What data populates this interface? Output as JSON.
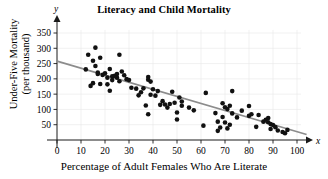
{
  "chart_data": {
    "type": "scatter",
    "title": "Literacy and Child Mortality",
    "xlabel": "Percentage of Adult Females Who Are Literate",
    "ylabel": "Under-Five Mortality (per thousand)",
    "ylabel_line1": "Under-Five Mortality",
    "ylabel_line2": "(per thousand)",
    "x_axis_symbol": "x",
    "y_axis_symbol": "y",
    "xlim": [
      0,
      100
    ],
    "ylim": [
      0,
      375
    ],
    "xticks": [
      0,
      10,
      20,
      30,
      40,
      50,
      60,
      70,
      80,
      90,
      100
    ],
    "yticks": [
      50,
      100,
      150,
      200,
      250,
      300,
      350
    ],
    "grid": true,
    "legend": "none",
    "marker_color": "#111111",
    "trendline": {
      "name": "least-squares regression line",
      "color": "#8c8c8c",
      "x_start": 0,
      "y_start": 258,
      "x_end": 104,
      "y_end": 18
    },
    "points": [
      [
        12,
        231
      ],
      [
        13,
        279
      ],
      [
        14,
        177
      ],
      [
        15,
        259
      ],
      [
        15,
        186
      ],
      [
        16,
        302
      ],
      [
        16,
        242
      ],
      [
        17,
        221
      ],
      [
        17,
        216
      ],
      [
        18,
        269
      ],
      [
        18,
        183
      ],
      [
        19,
        213
      ],
      [
        20,
        218
      ],
      [
        21,
        204
      ],
      [
        21,
        182
      ],
      [
        22,
        232
      ],
      [
        22,
        161
      ],
      [
        23,
        208
      ],
      [
        23,
        196
      ],
      [
        24,
        210
      ],
      [
        25,
        216
      ],
      [
        25,
        204
      ],
      [
        26,
        279
      ],
      [
        26,
        192
      ],
      [
        27,
        224
      ],
      [
        28,
        212
      ],
      [
        29,
        199
      ],
      [
        30,
        196
      ],
      [
        31,
        171
      ],
      [
        33,
        168
      ],
      [
        34,
        146
      ],
      [
        35,
        156
      ],
      [
        36,
        169
      ],
      [
        37,
        113
      ],
      [
        38,
        84
      ],
      [
        38,
        206
      ],
      [
        38,
        197
      ],
      [
        39,
        148
      ],
      [
        39,
        191
      ],
      [
        40,
        166
      ],
      [
        41,
        145
      ],
      [
        42,
        160
      ],
      [
        43,
        115
      ],
      [
        44,
        127
      ],
      [
        45,
        116
      ],
      [
        46,
        106
      ],
      [
        47,
        118
      ],
      [
        48,
        158
      ],
      [
        49,
        122
      ],
      [
        50,
        90
      ],
      [
        50,
        67
      ],
      [
        51,
        139
      ],
      [
        52,
        112
      ],
      [
        52,
        126
      ],
      [
        55,
        106
      ],
      [
        57,
        97
      ],
      [
        61,
        47
      ],
      [
        62,
        154
      ],
      [
        66,
        88
      ],
      [
        67,
        30
      ],
      [
        67,
        60
      ],
      [
        68,
        41
      ],
      [
        69,
        120
      ],
      [
        69,
        75
      ],
      [
        70,
        107
      ],
      [
        70,
        57
      ],
      [
        71,
        101
      ],
      [
        71,
        38
      ],
      [
        72,
        112
      ],
      [
        72,
        50
      ],
      [
        73,
        160
      ],
      [
        73,
        87
      ],
      [
        75,
        74
      ],
      [
        77,
        96
      ],
      [
        80,
        111
      ],
      [
        80,
        79
      ],
      [
        81,
        84
      ],
      [
        83,
        43
      ],
      [
        84,
        82
      ],
      [
        86,
        60
      ],
      [
        87,
        66
      ],
      [
        88,
        58
      ],
      [
        88,
        72
      ],
      [
        89,
        52
      ],
      [
        89,
        36
      ],
      [
        90,
        49
      ],
      [
        91,
        42
      ],
      [
        92,
        31
      ],
      [
        94,
        26
      ],
      [
        95,
        22
      ],
      [
        96,
        33
      ]
    ]
  }
}
